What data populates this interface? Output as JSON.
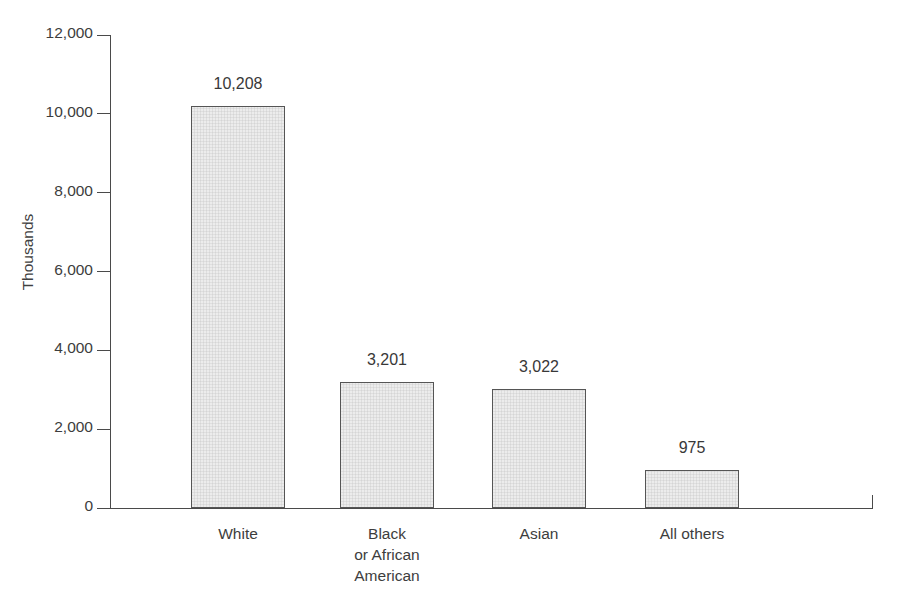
{
  "chart_data": {
    "type": "bar",
    "title": "",
    "subtitle": "",
    "xlabel": "",
    "ylabel": "Thousands",
    "categories": [
      "White",
      "Black\nor African\nAmerican",
      "Asian",
      "All others"
    ],
    "category_lines": [
      [
        "White"
      ],
      [
        "Black",
        "or African",
        "American"
      ],
      [
        "Asian"
      ],
      [
        "All others"
      ]
    ],
    "values": [
      10208,
      3201,
      3022,
      975
    ],
    "value_labels": [
      "10,208",
      "3,201",
      "3,022",
      "975"
    ],
    "ylim": [
      0,
      12000
    ],
    "ytick_values": [
      0,
      2000,
      4000,
      6000,
      8000,
      10000,
      12000
    ],
    "ytick_labels": [
      "0",
      "2,000",
      "4,000",
      "6,000",
      "8,000",
      "10,000",
      "12,000"
    ],
    "grid": false,
    "legend": null,
    "legend_position": "none",
    "bar_fill_color": "#ececec",
    "bar_border_color": "#555555",
    "axis_color": "#4a4a4a",
    "text_color": "#3d3d3d",
    "background_color": "#ffffff"
  },
  "artifacts": {
    "left": "",
    "right": "",
    "mid": ""
  }
}
